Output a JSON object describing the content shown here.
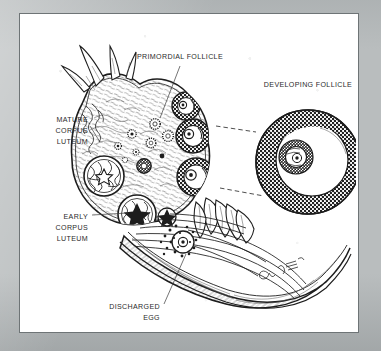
{
  "figure": {
    "medium": "pen-and-ink anatomical illustration",
    "page_background": "#ffffff",
    "mat_color": "#b9bdbe",
    "frame_line_color": "#6e7476",
    "ink_color": "#1d1d1d",
    "signature": "artist signature on fallopian tube"
  },
  "labels": [
    {
      "id": "primordial-follicle",
      "lines": [
        "PRIMORDIAL FOLLICLE"
      ],
      "anchor": "middle",
      "x": 160,
      "y": 45,
      "leader": "from below text down-left to small follicle in ovary cortex"
    },
    {
      "id": "developing-follicle",
      "lines": [
        "DEVELOPING FOLLICLE"
      ],
      "anchor": "middle",
      "x": 288,
      "y": 73,
      "leader": "none; titles the enlarged inset below"
    },
    {
      "id": "mature-corpus-luteum",
      "lines": [
        "MATURE",
        "CORPUS",
        "LUTEUM"
      ],
      "anchor": "end",
      "x": 68,
      "y": 108,
      "leader": "short line angling down-right to mature corpus luteum"
    },
    {
      "id": "early-corpus-luteum",
      "lines": [
        "EARLY",
        "CORPUS",
        "LUTEUM"
      ],
      "anchor": "end",
      "x": 68,
      "y": 205,
      "leader": "horizontal line right to early corpus luteum"
    },
    {
      "id": "discharged-egg",
      "lines": [
        "DISCHARGED",
        "EGG"
      ],
      "anchor": "end",
      "x": 140,
      "y": 295,
      "leader": "diagonal line up-right to discharged egg among fimbriae"
    }
  ],
  "structures": [
    {
      "id": "ovary-body",
      "name": "ovary stroma"
    },
    {
      "id": "primordial-follicles",
      "name": "primordial follicles",
      "count_visible": 9
    },
    {
      "id": "growing-follicles",
      "name": "growing antral follicles",
      "count_visible": 3
    },
    {
      "id": "mature-corpus-luteum",
      "name": "mature corpus luteum"
    },
    {
      "id": "early-corpus-luteum",
      "name": "early corpus luteum"
    },
    {
      "id": "discharged-egg",
      "name": "discharged egg"
    },
    {
      "id": "fimbriae",
      "name": "fimbriae of fallopian tube"
    },
    {
      "id": "fallopian-tube",
      "name": "fallopian tube"
    },
    {
      "id": "developing-follicle-inset",
      "name": "developing follicle, enlarged"
    }
  ],
  "inset": {
    "id": "developing-follicle-inset",
    "center_x": 288,
    "center_y": 148,
    "outer_radius": 52,
    "parts": [
      "granulosa cell layer",
      "antrum",
      "oocyte",
      "cumulus oophorus"
    ],
    "connector": "two dashed lines linking ovary follicle to enlarged inset"
  }
}
